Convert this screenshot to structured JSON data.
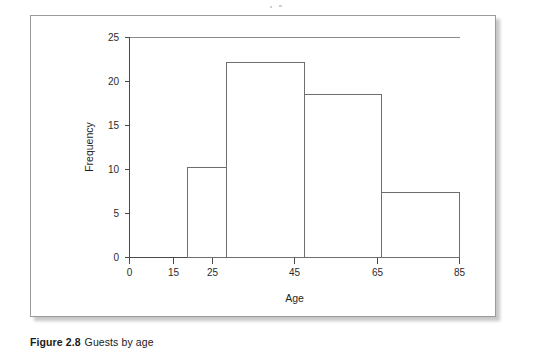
{
  "figure": {
    "caption_label": "Figure 2.8",
    "caption_text": "Guests by age"
  },
  "chart_data": {
    "type": "bar",
    "subtype": "histogram",
    "title": "",
    "xlabel": "Age",
    "ylabel": "Frequency",
    "xlim": [
      0,
      85
    ],
    "ylim": [
      0,
      25
    ],
    "grid": false,
    "legend": false,
    "x_ticks": [
      0,
      15,
      25,
      45,
      65,
      85
    ],
    "x_tick_labels": [
      "0",
      "15",
      "25",
      "45",
      "65",
      "85"
    ],
    "y_ticks": [
      0,
      5,
      10,
      15,
      20,
      25
    ],
    "y_tick_labels": [
      "0",
      "5",
      "10",
      "15",
      "20",
      "25"
    ],
    "bin_edges": [
      15,
      25,
      45,
      65,
      85
    ],
    "categories": [
      "15-25",
      "25-45",
      "45-65",
      "65-85"
    ],
    "values": [
      10.2,
      22.2,
      18.5,
      7.4
    ],
    "bars": [
      {
        "label": "15-25",
        "x_start": 15,
        "x_end": 25,
        "height": 10.2
      },
      {
        "label": "25-45",
        "x_start": 25,
        "x_end": 45,
        "height": 22.2
      },
      {
        "label": "45-65",
        "x_start": 45,
        "x_end": 65,
        "height": 18.5
      },
      {
        "label": "65-85",
        "x_start": 65,
        "x_end": 85,
        "height": 7.4
      }
    ],
    "bar_fill": "#ffffff",
    "bar_stroke": "#6e6e6e",
    "axis_color": "#4a4a4a",
    "background": "#ffffff"
  }
}
